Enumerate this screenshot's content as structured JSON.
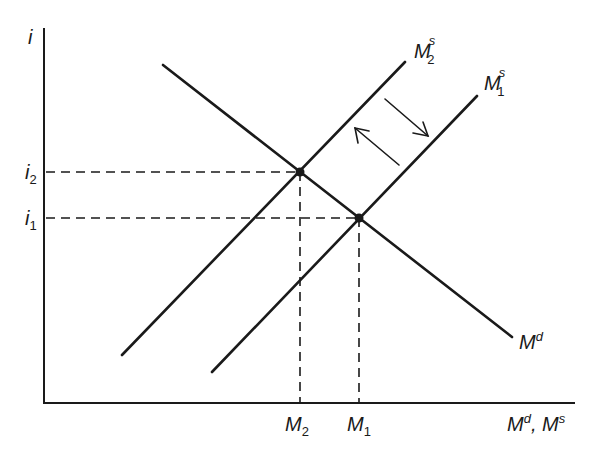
{
  "diagram": {
    "axes": {
      "y_label": "i",
      "x_label": "Md, Ms",
      "x_label_parts": {
        "main1": "M",
        "sup1": "d",
        "sep": ", ",
        "main2": "M",
        "sup2": "s"
      }
    },
    "curves": [
      {
        "id": "Md",
        "label_main": "M",
        "label_sup": "d",
        "type": "demand",
        "from": [
          163,
          65
        ],
        "to": [
          512,
          337
        ]
      },
      {
        "id": "M2s",
        "label_main": "M",
        "label_sup": "s",
        "label_sub": "2",
        "type": "supply",
        "from": [
          122,
          355
        ],
        "to": [
          405,
          62
        ]
      },
      {
        "id": "M1s",
        "label_main": "M",
        "label_sup": "s",
        "label_sub": "1",
        "type": "supply",
        "from": [
          212,
          372
        ],
        "to": [
          477,
          96
        ]
      }
    ],
    "equilibria": [
      {
        "id": "E2",
        "i_label": "i",
        "i_sub": "2",
        "m_label": "M",
        "m_sub": "2",
        "point": [
          300,
          172
        ]
      },
      {
        "id": "E1",
        "i_label": "i",
        "i_sub": "1",
        "m_label": "M",
        "m_sub": "1",
        "point": [
          359,
          218
        ]
      }
    ],
    "arrows": [
      {
        "id": "shift-right",
        "direction": "down-right",
        "from": [
          385,
          99
        ],
        "to": [
          428,
          136
        ]
      },
      {
        "id": "shift-left",
        "direction": "up-left",
        "from": [
          399,
          165
        ],
        "to": [
          355,
          128
        ]
      }
    ],
    "colors": {
      "ink": "#1a1a1a",
      "background": "#ffffff"
    }
  }
}
